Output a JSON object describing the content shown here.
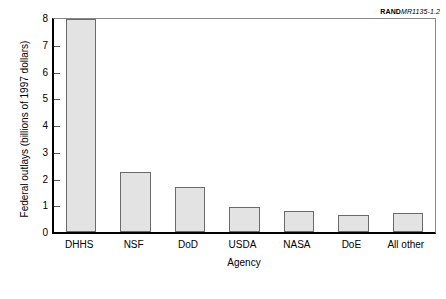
{
  "figure_id": {
    "mark": "RAND",
    "document": "MR1135-1.2"
  },
  "chart_data": {
    "type": "bar",
    "title": "",
    "xlabel": "Agency",
    "ylabel": "Federal outlays (billions of 1997 dollars)",
    "categories": [
      "DHHS",
      "NSF",
      "DoD",
      "USDA",
      "NASA",
      "DoE",
      "All other"
    ],
    "values": [
      7.95,
      2.25,
      1.7,
      0.95,
      0.8,
      0.62,
      0.72
    ],
    "ylim": [
      0,
      8
    ],
    "ytick_labels": [
      "0",
      "1",
      "2",
      "3",
      "4",
      "5",
      "6",
      "7",
      "8"
    ],
    "ytick_values": [
      0,
      1,
      2,
      3,
      4,
      5,
      6,
      7,
      8
    ],
    "grid": false,
    "legend": null,
    "bar_fill_color": "#e3e3e3",
    "bar_edge_color": "#6a6a6a",
    "axis_color": "#000000"
  }
}
